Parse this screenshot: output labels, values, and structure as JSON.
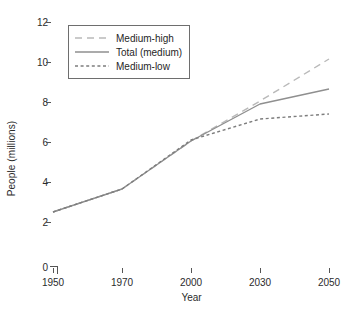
{
  "chart_data": {
    "type": "line",
    "title": "",
    "xlabel": "Year",
    "ylabel": "People (millions)",
    "x": [
      1950,
      1970,
      2000,
      2030,
      2050
    ],
    "xtick_labels": [
      "1950",
      "1970",
      "2000",
      "2030",
      "2050"
    ],
    "ytick_labels": [
      "0",
      "2",
      "4",
      "6",
      "8",
      "10",
      "12"
    ],
    "ytick_values": [
      0,
      2,
      4,
      6,
      8,
      10,
      12
    ],
    "ylim": [
      0,
      12
    ],
    "xlim": [
      1950,
      2050
    ],
    "axis_break": true,
    "grid": false,
    "legend_position": "upper-left-inside",
    "series": [
      {
        "name": "Medium-high",
        "values": [
          2.55,
          3.7,
          6.1,
          8.1,
          10.2
        ],
        "style": "long-dashed",
        "color": "#b9b9b9"
      },
      {
        "name": "Total (medium)",
        "values": [
          2.55,
          3.7,
          6.1,
          7.95,
          8.7
        ],
        "style": "solid",
        "color": "#8f8f8f"
      },
      {
        "name": "Medium-low",
        "values": [
          2.55,
          3.7,
          6.15,
          7.2,
          7.45
        ],
        "style": "short-dashed",
        "color": "#7d7d7d"
      }
    ]
  },
  "axes": {
    "y_label": "People (millions)",
    "x_label": "Year",
    "y_ticks": [
      "12",
      "10",
      "8",
      "6",
      "4",
      "2",
      "0"
    ],
    "x_ticks": [
      "1950",
      "1970",
      "2000",
      "2030",
      "2050"
    ]
  },
  "legend": {
    "items": [
      {
        "label": "Medium-high"
      },
      {
        "label": "Total (medium)"
      },
      {
        "label": "Medium-low"
      }
    ]
  },
  "colors": {
    "background": "#ffffff",
    "axis": "#555555",
    "text": "#2b2b2b",
    "medium_high": "#b9b9b9",
    "total_medium": "#8f8f8f",
    "medium_low": "#7d7d7d",
    "legend_border": "#6e6e6e"
  }
}
